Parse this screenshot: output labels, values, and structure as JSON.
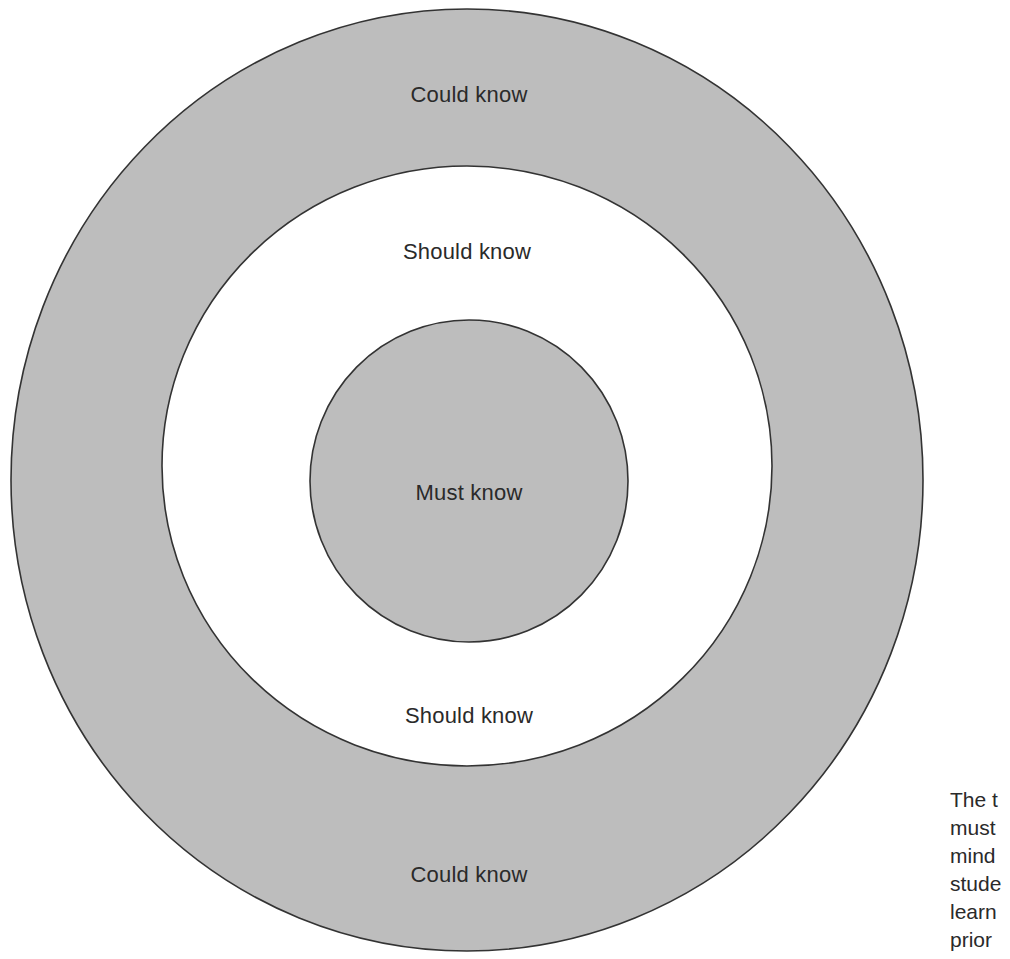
{
  "diagram": {
    "type": "concentric-priority-target",
    "colors": {
      "shaded_fill": "#bdbdbd",
      "unshaded_fill": "#ffffff",
      "outline": "#333333",
      "text": "#2a2a2a"
    },
    "zones": [
      {
        "id": "outer",
        "name": "Could know",
        "fill": "shaded",
        "ellipse": {
          "cx": 467,
          "cy": 480,
          "rx": 456,
          "ry": 471
        }
      },
      {
        "id": "middle",
        "name": "Should know",
        "fill": "unshaded",
        "ellipse": {
          "cx": 467,
          "cy": 466,
          "rx": 305,
          "ry": 300
        }
      },
      {
        "id": "inner",
        "name": "Must know",
        "fill": "shaded",
        "ellipse": {
          "cx": 469,
          "cy": 481,
          "rx": 159,
          "ry": 161
        }
      }
    ],
    "labels": {
      "could_top": "Could know",
      "should_top": "Should know",
      "must": "Must know",
      "should_bottom": "Should know",
      "could_bottom": "Could know"
    }
  },
  "caption": {
    "lines": [
      "The t",
      "must",
      "mind",
      "stude",
      "learn",
      "prior"
    ]
  }
}
